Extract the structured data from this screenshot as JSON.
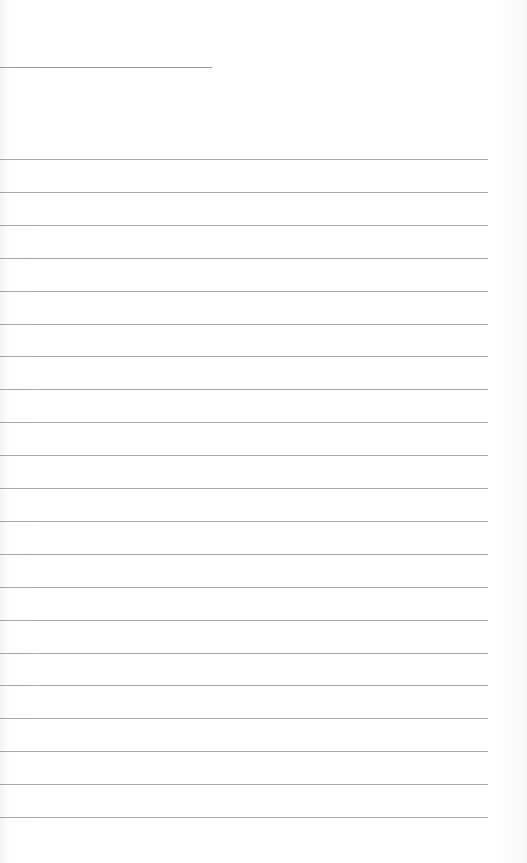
{
  "page": {
    "type": "lined-paper",
    "background_color": "#fdfdfd",
    "line_color": "#a8a8a8",
    "header_line": {
      "x": 0,
      "y": 67,
      "width": 212
    },
    "rules": {
      "count": 21,
      "start_y": 159,
      "spacing": 32.9,
      "x": 0,
      "width": 488
    },
    "text": []
  }
}
